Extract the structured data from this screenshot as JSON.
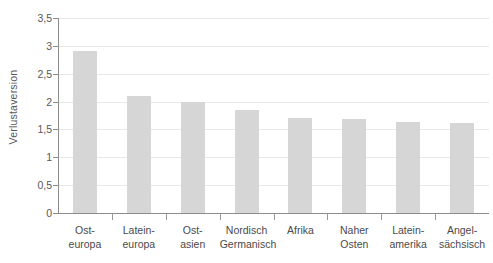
{
  "chart_data": {
    "type": "bar",
    "title": "",
    "subtitle": "",
    "xlabel": "",
    "ylabel": "Verlustaversion",
    "ylim": [
      0,
      3.5
    ],
    "ytick_step": 0.5,
    "grid": true,
    "legend": "none",
    "decimal_separator": ",",
    "orientation": "vertical",
    "categories": [
      "Ost-europa",
      "Latein-europa",
      "Ost-asien",
      "Nordisch Germanisch",
      "Afrika",
      "Naher Osten",
      "Latein-amerika",
      "Angel-sächsisch"
    ],
    "category_lines": [
      [
        "Ost-",
        "europa"
      ],
      [
        "Latein-",
        "europa"
      ],
      [
        "Ost-",
        "asien"
      ],
      [
        "Nordisch",
        "Germanisch"
      ],
      [
        "Afrika"
      ],
      [
        "Naher",
        "Osten"
      ],
      [
        "Latein-",
        "amerika"
      ],
      [
        "Angel-",
        "sächsisch"
      ]
    ],
    "values": [
      2.9,
      2.1,
      2.0,
      1.85,
      1.7,
      1.68,
      1.63,
      1.62
    ],
    "ytick_labels": [
      "0",
      "0,5",
      "1",
      "1,5",
      "2",
      "2,5",
      "3",
      "3,5"
    ],
    "ytick_values": [
      0,
      0.5,
      1,
      1.5,
      2,
      2.5,
      3,
      3.5
    ],
    "colors": {
      "bar": "#d6d6d6",
      "gridline": "#e8e8e8",
      "axis": "#8c8c8c",
      "tick_text": "#58585a",
      "label_text": "#4a4a4a",
      "background": "#ffffff"
    }
  }
}
